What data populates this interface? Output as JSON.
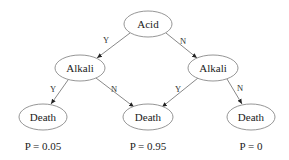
{
  "diagram": {
    "type": "decision-tree",
    "nodes": [
      {
        "id": "acid",
        "label": "Acid",
        "cx": 148,
        "cy": 24,
        "rx": 24,
        "ry": 13
      },
      {
        "id": "alkali_left",
        "label": "Alkali",
        "cx": 80,
        "cy": 68,
        "rx": 25,
        "ry": 13
      },
      {
        "id": "alkali_right",
        "label": "Alkali",
        "cx": 213,
        "cy": 68,
        "rx": 25,
        "ry": 13
      },
      {
        "id": "death_left",
        "label": "Death",
        "cx": 43,
        "cy": 117,
        "rx": 24,
        "ry": 13
      },
      {
        "id": "death_middle",
        "label": "Death",
        "cx": 148,
        "cy": 117,
        "rx": 25,
        "ry": 13
      },
      {
        "id": "death_right",
        "label": "Death",
        "cx": 251,
        "cy": 117,
        "rx": 24,
        "ry": 13
      }
    ],
    "edges": [
      {
        "from": "acid",
        "to": "alkali_left",
        "label": "Y",
        "x1": 130,
        "y1": 33,
        "x2": 97,
        "y2": 58,
        "lx": 106,
        "ly": 40
      },
      {
        "from": "acid",
        "to": "alkali_right",
        "label": "N",
        "x1": 166,
        "y1": 33,
        "x2": 197,
        "y2": 58,
        "lx": 183,
        "ly": 41
      },
      {
        "from": "alkali_left",
        "to": "death_left",
        "label": "Y",
        "x1": 68,
        "y1": 80,
        "x2": 51,
        "y2": 104,
        "lx": 53,
        "ly": 89
      },
      {
        "from": "alkali_left",
        "to": "death_middle",
        "label": "N",
        "x1": 96,
        "y1": 78,
        "x2": 134,
        "y2": 107,
        "lx": 114,
        "ly": 89
      },
      {
        "from": "alkali_right",
        "to": "death_middle",
        "label": "Y",
        "x1": 198,
        "y1": 78,
        "x2": 162,
        "y2": 107,
        "lx": 178,
        "ly": 89
      },
      {
        "from": "alkali_right",
        "to": "death_right",
        "label": "N",
        "x1": 227,
        "y1": 79,
        "x2": 242,
        "y2": 104,
        "lx": 240,
        "ly": 88
      }
    ],
    "probabilities": [
      {
        "label": "P = 0.05",
        "x": 43,
        "y": 146
      },
      {
        "label": "P = 0.95",
        "x": 148,
        "y": 146
      },
      {
        "label": "P = 0",
        "x": 251,
        "y": 146
      }
    ]
  }
}
